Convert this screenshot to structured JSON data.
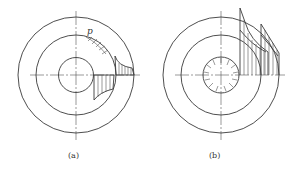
{
  "figure": {
    "panels": [
      {
        "id": "a",
        "caption": "(a)",
        "symbol": "p",
        "center": [
          76,
          75
        ],
        "radii": {
          "outer": 58,
          "middle": 40,
          "inner": 17.5
        },
        "description": "Concentric circles with radial pressure p arrows on middle circle and hatched stress distributions"
      },
      {
        "id": "b",
        "caption": "(b)",
        "center": [
          221,
          75
        ],
        "radii": {
          "outer": 58,
          "middle": 40,
          "inner": 18
        },
        "description": "Concentric circles with inner hole under radial pressure and hatched stress distributions extending beyond outer circle"
      }
    ]
  }
}
